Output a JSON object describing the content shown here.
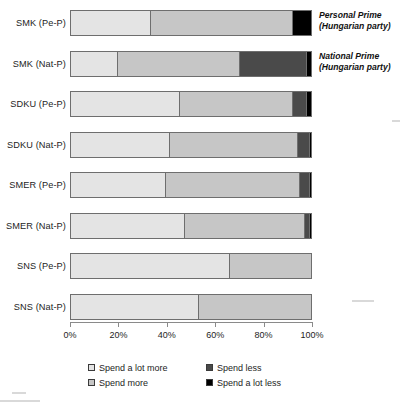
{
  "chart_data": {
    "type": "bar",
    "orientation": "horizontal",
    "stacked": true,
    "title": "",
    "xlabel": "",
    "ylabel": "",
    "xlim": [
      0,
      100
    ],
    "grid": false,
    "legend_position": "bottom",
    "categories": [
      "SMK (Pe-P)",
      "SMK (Nat-P)",
      "SDKU (Pe-P)",
      "SDKU (Nat-P)",
      "SMER (Pe-P)",
      "SMER (Nat-P)",
      "SNS (Pe-P)",
      "SNS (Nat-P)"
    ],
    "series": [
      {
        "name": "Spend a lot more",
        "color": "#e4e4e4",
        "values": [
          33,
          19,
          45,
          41,
          39,
          47,
          66,
          53
        ]
      },
      {
        "name": "Spend more",
        "color": "#c6c6c6",
        "values": [
          59,
          51,
          47,
          53,
          56,
          50,
          34,
          47
        ]
      },
      {
        "name": "Spend less",
        "color": "#4a4a4a",
        "values": [
          0,
          28,
          6,
          5,
          4,
          2,
          0,
          0
        ]
      },
      {
        "name": "Spend a lot less",
        "color": "#000000",
        "values": [
          8,
          2,
          2,
          1,
          1,
          1,
          0,
          0
        ]
      }
    ],
    "ticks": [
      "0%",
      "20%",
      "40%",
      "60%",
      "80%",
      "100%"
    ],
    "tick_values": [
      0,
      20,
      40,
      60,
      80,
      100
    ],
    "annotations": [
      {
        "row": 0,
        "line1": "Personal Prime",
        "line2": "(Hungarian party)"
      },
      {
        "row": 1,
        "line1": "National Prime",
        "line2": "(Hungarian party)"
      }
    ]
  },
  "legend": {
    "items": [
      {
        "label": "Spend a lot more",
        "color": "#e4e4e4"
      },
      {
        "label": "Spend less",
        "color": "#4a4a4a"
      },
      {
        "label": "Spend more",
        "color": "#c6c6c6"
      },
      {
        "label": "Spend a lot less",
        "color": "#000000"
      }
    ]
  }
}
